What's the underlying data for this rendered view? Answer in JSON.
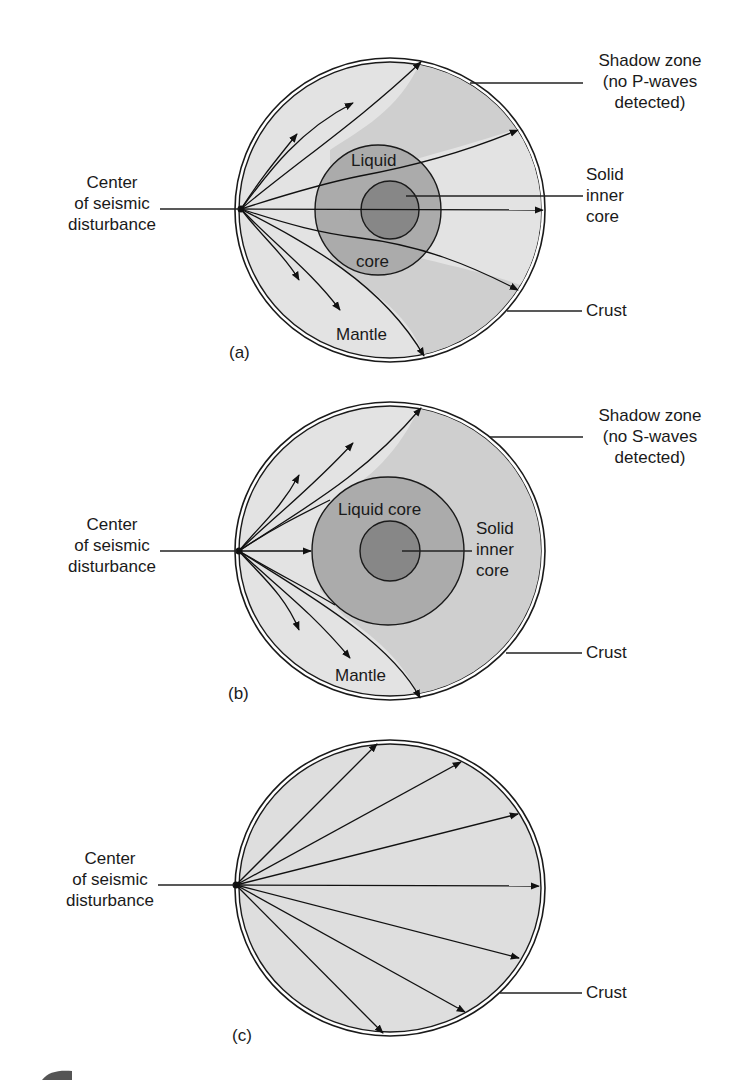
{
  "figure": {
    "panels": [
      {
        "id": "a",
        "tag": "(a)",
        "wave_type": "P-waves",
        "labels": {
          "source": [
            "Center",
            "of seismic",
            "disturbance"
          ],
          "shadow": [
            "Shadow zone",
            "(no P-waves",
            "detected)"
          ],
          "inner_core": [
            "Solid",
            "inner",
            "core"
          ],
          "crust": "Crust",
          "liquid_top": "Liquid",
          "liquid_bottom": "core",
          "mantle": "Mantle"
        }
      },
      {
        "id": "b",
        "tag": "(b)",
        "wave_type": "S-waves",
        "labels": {
          "source": [
            "Center",
            "of seismic",
            "disturbance"
          ],
          "shadow": [
            "Shadow zone",
            "(no S-waves",
            "detected)"
          ],
          "inner_core": [
            "Solid",
            "inner",
            "core"
          ],
          "crust": "Crust",
          "liquid": "Liquid core",
          "mantle": "Mantle"
        }
      },
      {
        "id": "c",
        "tag": "(c)",
        "labels": {
          "source": [
            "Center",
            "of seismic",
            "disturbance"
          ],
          "crust": "Crust"
        }
      }
    ],
    "colors": {
      "mantle": "#e3e3e3",
      "shadow_zone": "#cfcfcf",
      "liquid_core": "#ababab",
      "inner_core": "#878787",
      "stroke": "#1a1a1a",
      "background": "#ffffff"
    }
  }
}
